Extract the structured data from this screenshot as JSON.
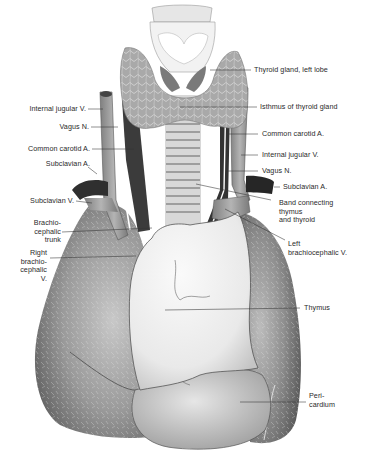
{
  "figure": {
    "signature": "Gebhard"
  },
  "labels": {
    "thyroid_left_lobe": "Thyroid gland, left lobe",
    "isthmus": "Isthmus of thyroid gland",
    "common_carotid_right": "Common carotid A.",
    "internal_jugular_right": "Internal jugular V.",
    "vagus_right": "Vagus N.",
    "subclavian_a_right": "Subclavian A.",
    "band": "Band connecting\nthymus\nand thyroid",
    "left_brachiocephalic": "Left\nbrachiocephalic V.",
    "thymus": "Thymus",
    "pericardium": "Peri-\ncardium",
    "internal_jugular_left": "Internal jugular V.",
    "vagus_left": "Vagus N.",
    "common_carotid_left": "Common carotid A.",
    "subclavian_a_left": "Subclavian A.",
    "subclavian_v": "Subclavian V.",
    "brachiocephalic_trunk": "Brachio-\ncephalic\ntrunk",
    "right_brachiocephalic": "Right\nbrachio-\ncephalic\nV."
  },
  "colors": {
    "lung": "#6e6e6e",
    "lung_light": "#bdbdbd",
    "thymus": "#f2f2f2",
    "pericardium": "#c9c9c9",
    "thyroid": "#a8a8a8",
    "vein": "#9a9a9a",
    "artery": "#3a3a3a",
    "leader": "#333333"
  }
}
